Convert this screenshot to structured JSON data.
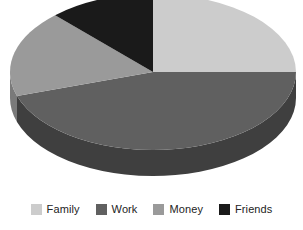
{
  "chart": {
    "type_label": "3d-pie-chart",
    "background_color": "#ffffff"
  },
  "chart_data": {
    "type": "pie",
    "title": "",
    "subtitle": "",
    "xlabel": "",
    "ylabel": "",
    "grid": false,
    "legend_position": "bottom",
    "three_d": true,
    "start_angle_deg": 0,
    "direction": "clockwise",
    "categories": [
      "Family",
      "Work",
      "Money",
      "Friends"
    ],
    "values": [
      25,
      45,
      18,
      12
    ],
    "units": "percent",
    "colors": [
      "#cccccc",
      "#606060",
      "#9a9a9a",
      "#1a1a1a"
    ],
    "side_colors": [
      "#a8a8a8",
      "#3f3f3f",
      "#7a7a7a",
      "#0d0d0d"
    ],
    "slices": [
      {
        "label": "Family",
        "value": 25,
        "color": "#cccccc",
        "side_color": "#a8a8a8"
      },
      {
        "label": "Work",
        "value": 45,
        "color": "#606060",
        "side_color": "#3f3f3f"
      },
      {
        "label": "Money",
        "value": 18,
        "color": "#9a9a9a",
        "side_color": "#7a7a7a"
      },
      {
        "label": "Friends",
        "value": 12,
        "color": "#1a1a1a",
        "side_color": "#0d0d0d"
      }
    ]
  },
  "legend": {
    "items": [
      {
        "label": "Family",
        "color": "#cccccc"
      },
      {
        "label": "Work",
        "color": "#606060"
      },
      {
        "label": "Money",
        "color": "#9a9a9a"
      },
      {
        "label": "Friends",
        "color": "#1a1a1a"
      }
    ]
  },
  "geometry": {
    "cx": 153,
    "cy": 72,
    "rx": 143,
    "ry": 78,
    "depth": 26
  }
}
